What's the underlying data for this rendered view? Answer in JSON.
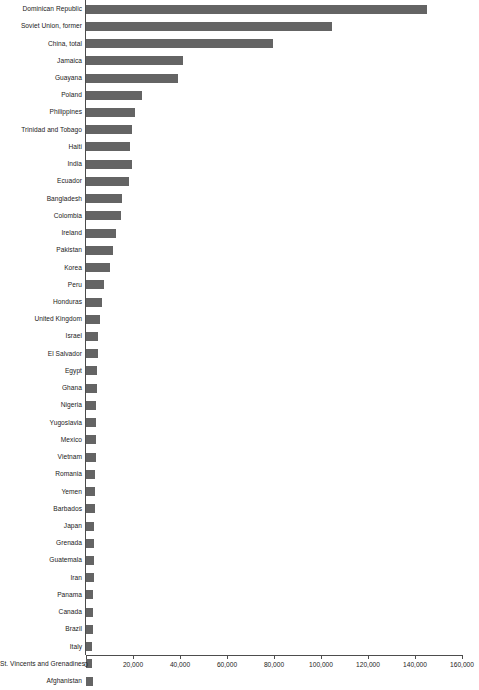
{
  "chart_data": {
    "type": "bar",
    "orientation": "horizontal",
    "title": "",
    "subtitle": "",
    "xlabel": "",
    "ylabel": "",
    "xlim": [
      0,
      160000
    ],
    "ylim": null,
    "grid": false,
    "legend": null,
    "series_color": "#646464",
    "axis_color": "#4d4d4d",
    "xticks": [
      0,
      20000,
      40000,
      60000,
      80000,
      100000,
      120000,
      140000,
      160000
    ],
    "xticklabels": [
      "0",
      "20,000",
      "40,000",
      "60,000",
      "80,000",
      "100,000",
      "120,000",
      "140,000",
      "160,000"
    ],
    "categories": [
      "Dominican Republic",
      "Soviet Union, former",
      "China, total",
      "Jamaica",
      "Guayana",
      "Poland",
      "Philippines",
      "Trinidad and Tobago",
      "Haiti",
      "India",
      "Ecuador",
      "Bangladesh",
      "Colombia",
      "Ireland",
      "Pakistan",
      "Korea",
      "Peru",
      "Honduras",
      "United Kingdom",
      "Israel",
      "El Salvador",
      "Egypt",
      "Ghana",
      "Nigeria",
      "Yugoslavia",
      "Mexico",
      "Vietnam",
      "Romania",
      "Yemen",
      "Barbados",
      "Japan",
      "Grenada",
      "Guatemala",
      "Iran",
      "Panama",
      "Canada",
      "Brazil",
      "Italy",
      "St. Vincents and Grenadines",
      "Afghanistan"
    ],
    "values": [
      145100,
      104700,
      79600,
      41300,
      39100,
      23800,
      20900,
      19600,
      18700,
      19600,
      18300,
      15300,
      14900,
      12800,
      11500,
      10200,
      7700,
      6800,
      6000,
      5100,
      5100,
      4700,
      4700,
      4300,
      4300,
      4300,
      4300,
      4000,
      4000,
      3800,
      3400,
      3400,
      3400,
      3400,
      3000,
      3000,
      3000,
      2600,
      2600,
      3000
    ]
  }
}
